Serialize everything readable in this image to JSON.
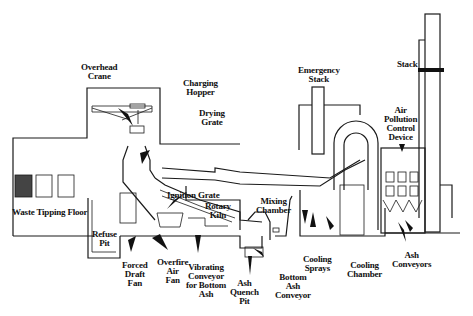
{
  "diagram": {
    "labels": {
      "overhead_crane": "Overhead\nCrane",
      "charging_hopper": "Charging\nHopper",
      "drying_grate": "Drying\nGrate",
      "emergency_stack": "Emergency\nStack",
      "stack": "Stack",
      "air_pollution_control_device": "Air\nPollution\nControl\nDevice",
      "waste_tipping_floor": "Waste Tipping Floor",
      "refuse_pit": "Refuse\nPit",
      "ignition_grate": "Ignition Grate",
      "rotary_kiln": "Rotary\nKiln",
      "mixing_chamber": "Mixing\nChamber",
      "forced_draft_fan": "Forced\nDraft\nFan",
      "overfire_air_fan": "Overfire\nAir\nFan",
      "vibrating_conveyor": "Vibrating\nConveyor\nfor Bottom\nAsh",
      "ash_quench_pit": "Ash\nQuench\nPit",
      "bottom_ash_conveyor": "Bottom\nAsh\nConveyor",
      "cooling_sprays": "Cooling\nSprays",
      "cooling_chamber": "Cooling\nChamber",
      "ash_conveyors": "Ash\nConveyors"
    },
    "colors": {
      "line": "#1a1a1a",
      "background": "#ffffff"
    }
  }
}
